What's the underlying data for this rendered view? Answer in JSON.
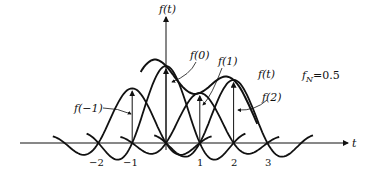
{
  "diagram": {
    "axis": {
      "x_label": "t",
      "y_label": "f(t)"
    },
    "ticks": [
      {
        "value": -2,
        "label": "−2"
      },
      {
        "value": -1,
        "label": "−1"
      },
      {
        "value": 1,
        "label": "1"
      },
      {
        "value": 2,
        "label": "2"
      },
      {
        "value": 3,
        "label": "3"
      }
    ],
    "labels": {
      "f0": "f(0)",
      "f1": "f(1)",
      "fm1": "f(−1)",
      "f2": "f(2)",
      "ft": "f(t)",
      "fN": "f",
      "fN_sub": "N",
      "fN_value": "=0.5"
    },
    "samples": [
      {
        "t": -1,
        "value": 0.71
      },
      {
        "t": 0,
        "value": 1.0
      },
      {
        "t": 1,
        "value": 0.65
      },
      {
        "t": 2,
        "value": 0.82
      }
    ],
    "nyquist_frequency": 0.5
  }
}
